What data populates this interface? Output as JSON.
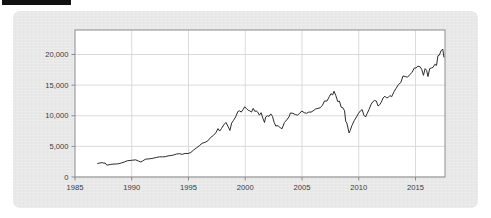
{
  "figure": {
    "redaction_bar_color": "#111111",
    "panel_color": "#e9e9e9",
    "plot_background": "#ffffff",
    "plot_border_color": "#8c8c8c",
    "gridline_color": "#d2d2d2",
    "series_color": "#2b2b2b",
    "tick_label_color": "#3a3a3a"
  },
  "chart_data": {
    "type": "line",
    "title": "",
    "subtitle": "",
    "xlabel": "",
    "ylabel": "",
    "xlim": [
      1985,
      2017.6
    ],
    "ylim": [
      0,
      24000
    ],
    "grid": true,
    "legend": false,
    "legend_position": "none",
    "x_tick_labels": [
      "1985",
      "1990",
      "1995",
      "2000",
      "2005",
      "2010",
      "2015"
    ],
    "x_ticks": [
      1985,
      1990,
      1995,
      2000,
      2005,
      2010,
      2015
    ],
    "y_tick_labels": [
      "0",
      "5,000",
      "10,000",
      "15,000",
      "20,000"
    ],
    "y_ticks": [
      0,
      5000,
      10000,
      15000,
      20000
    ],
    "series": [
      {
        "name": "Index level",
        "x": [
          1987.0,
          1987.2,
          1987.4,
          1987.55,
          1987.65,
          1987.8,
          1987.9,
          1988.1,
          1988.35,
          1988.6,
          1988.85,
          1989.1,
          1989.35,
          1989.6,
          1989.85,
          1990.1,
          1990.35,
          1990.6,
          1990.8,
          1990.95,
          1991.2,
          1991.45,
          1991.7,
          1991.95,
          1992.2,
          1992.45,
          1992.7,
          1992.95,
          1993.2,
          1993.45,
          1993.7,
          1993.95,
          1994.2,
          1994.45,
          1994.7,
          1994.95,
          1995.2,
          1995.45,
          1995.7,
          1995.95,
          1996.2,
          1996.45,
          1996.7,
          1996.95,
          1997.2,
          1997.4,
          1997.6,
          1997.75,
          1997.9,
          1998.1,
          1998.3,
          1998.5,
          1998.65,
          1998.8,
          1998.95,
          1999.15,
          1999.35,
          1999.5,
          1999.65,
          1999.8,
          1999.95,
          2000.1,
          2000.25,
          2000.4,
          2000.55,
          2000.7,
          2000.85,
          2000.95,
          2001.1,
          2001.25,
          2001.4,
          2001.55,
          2001.7,
          2001.8,
          2001.95,
          2002.1,
          2002.25,
          2002.4,
          2002.55,
          2002.7,
          2002.8,
          2002.95,
          2003.1,
          2003.25,
          2003.45,
          2003.65,
          2003.85,
          2003.98,
          2004.2,
          2004.4,
          2004.6,
          2004.8,
          2004.98,
          2005.2,
          2005.4,
          2005.6,
          2005.8,
          2005.98,
          2006.2,
          2006.4,
          2006.6,
          2006.8,
          2006.98,
          2007.2,
          2007.4,
          2007.55,
          2007.7,
          2007.82,
          2007.98,
          2008.15,
          2008.3,
          2008.45,
          2008.6,
          2008.75,
          2008.85,
          2008.95,
          2009.05,
          2009.15,
          2009.25,
          2009.4,
          2009.6,
          2009.8,
          2009.98,
          2010.15,
          2010.3,
          2010.45,
          2010.6,
          2010.75,
          2010.9,
          2011.1,
          2011.25,
          2011.4,
          2011.55,
          2011.7,
          2011.85,
          2011.98,
          2012.15,
          2012.3,
          2012.45,
          2012.6,
          2012.75,
          2012.9,
          2013.1,
          2013.3,
          2013.5,
          2013.7,
          2013.9,
          2014.1,
          2014.3,
          2014.5,
          2014.7,
          2014.9,
          2015.05,
          2015.2,
          2015.4,
          2015.55,
          2015.7,
          2015.85,
          2015.98,
          2016.1,
          2016.25,
          2016.4,
          2016.55,
          2016.7,
          2016.85,
          2016.98,
          2017.1,
          2017.25,
          2017.4,
          2017.5
        ],
        "y": [
          2200,
          2300,
          2350,
          2250,
          2300,
          1950,
          1950,
          2050,
          2100,
          2120,
          2170,
          2300,
          2450,
          2650,
          2700,
          2750,
          2800,
          2600,
          2450,
          2600,
          2900,
          2950,
          3000,
          3100,
          3200,
          3300,
          3280,
          3320,
          3450,
          3500,
          3600,
          3750,
          3800,
          3700,
          3850,
          3830,
          4000,
          4400,
          4750,
          5100,
          5500,
          5650,
          5900,
          6450,
          6800,
          7200,
          7900,
          7500,
          7900,
          8500,
          8900,
          8200,
          7600,
          8800,
          9200,
          9800,
          10700,
          10800,
          10600,
          11000,
          11450,
          11200,
          10900,
          10800,
          10600,
          11200,
          10700,
          10800,
          10600,
          10100,
          10500,
          9600,
          8900,
          9800,
          10000,
          9900,
          10300,
          9900,
          8900,
          8300,
          8400,
          8300,
          8000,
          7900,
          8900,
          9300,
          9800,
          10450,
          10400,
          10200,
          10100,
          10400,
          10780,
          10500,
          10400,
          10600,
          10600,
          10800,
          11100,
          11200,
          11300,
          11700,
          12400,
          12400,
          13100,
          13600,
          13400,
          14000,
          13300,
          12300,
          12400,
          11400,
          11300,
          10800,
          9100,
          8800,
          8000,
          7200,
          7600,
          8400,
          9200,
          9800,
          10400,
          10800,
          11000,
          10100,
          9800,
          10400,
          11000,
          11900,
          12300,
          12500,
          12400,
          11600,
          11800,
          12200,
          12900,
          13200,
          12900,
          13000,
          13300,
          13100,
          13900,
          14500,
          15100,
          15400,
          16500,
          16400,
          16300,
          16700,
          17100,
          17800,
          17800,
          18100,
          18000,
          17600,
          16600,
          17700,
          17400,
          16400,
          17700,
          17800,
          17900,
          18400,
          18200,
          19800,
          19900,
          20600,
          20900,
          19600
        ]
      }
    ]
  }
}
